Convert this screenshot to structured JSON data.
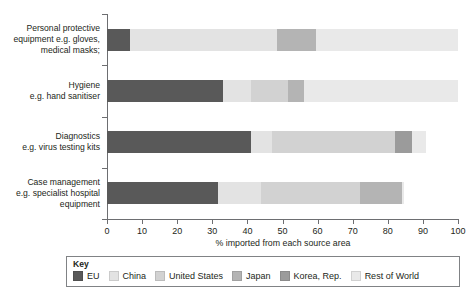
{
  "chart_data": {
    "type": "bar",
    "orientation": "horizontal",
    "stacked": true,
    "title": "",
    "xlabel": "% imported from each source area",
    "ylabel": "",
    "xlim": [
      0,
      100
    ],
    "xticks": [
      "0",
      "10",
      "20",
      "30",
      "40",
      "50",
      "60",
      "70",
      "80",
      "90",
      "100"
    ],
    "grid": false,
    "legend_position": "bottom",
    "legend_title": "Key",
    "categories": [
      "Personal protective equipment e.g. gloves, medical masks;",
      "Hygiene e.g. hand sanitiser",
      "Diagnostics e.g. virus testing kits",
      "Case management e.g. specialist hospital equipment"
    ],
    "category_lines": [
      [
        "Personal protective",
        "equipment e.g. gloves,",
        "medical masks;"
      ],
      [
        "Hygiene",
        "e.g. hand sanitiser"
      ],
      [
        "Diagnostics",
        "e.g. virus testing kits"
      ],
      [
        "Case management",
        "e.g. specialist hospital",
        "equipment"
      ]
    ],
    "series": [
      {
        "name": "EU",
        "color": "#595959",
        "values": [
          6.5,
          33.0,
          41.0,
          31.5
        ]
      },
      {
        "name": "China",
        "color": "#e3e3e3",
        "values": [
          42.0,
          8.0,
          6.0,
          12.5
        ]
      },
      {
        "name": "United States",
        "color": "#d2d2d2",
        "values": [
          0.0,
          10.5,
          35.0,
          28.0
        ]
      },
      {
        "name": "Japan",
        "color": "#b4b4b4",
        "values": [
          11.0,
          4.5,
          0.0,
          12.0
        ]
      },
      {
        "name": "Korea, Rep.",
        "color": "#9b9b9b",
        "values": [
          0.0,
          0.0,
          5.0,
          0.0
        ]
      },
      {
        "name": "Rest of World",
        "color": "#e9e9e9",
        "values": [
          40.5,
          44.0,
          4.0,
          0.5
        ]
      }
    ],
    "bar_totals": [
      100.0,
      100.0,
      91.0,
      84.5
    ]
  },
  "axis": {
    "title": "% imported from each source area"
  },
  "legend": {
    "title": "Key",
    "entries": [
      {
        "label": "EU",
        "color": "#595959"
      },
      {
        "label": "China",
        "color": "#e3e3e3"
      },
      {
        "label": "United States",
        "color": "#d2d2d2"
      },
      {
        "label": "Japan",
        "color": "#b4b4b4"
      },
      {
        "label": "Korea, Rep.",
        "color": "#9b9b9b"
      },
      {
        "label": "Rest of World",
        "color": "#e9e9e9"
      }
    ]
  }
}
